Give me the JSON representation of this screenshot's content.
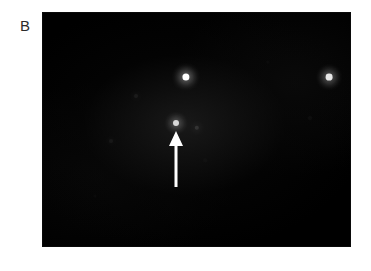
{
  "figure": {
    "panel_label": "B",
    "label_color": "#2b2b2b",
    "background_color": "#ffffff",
    "image_background_color": "#000000",
    "image_region": {
      "x": 43,
      "y": 13,
      "width": 307,
      "height": 233
    },
    "modality": "dark-field fluorescence micrograph"
  },
  "annotations": {
    "arrow": {
      "name": "arrow-indicator",
      "direction": "up",
      "color": "#ffffff",
      "tip_x": 176,
      "tip_y": 131,
      "tail_y": 187,
      "head_width": 14,
      "head_height": 15,
      "shaft_width": 3,
      "points_to": "bright-spot-center"
    }
  },
  "spots": [
    {
      "name": "bright-spot-upper-center",
      "x": 186,
      "y": 77,
      "radius": 3.6,
      "brightness": "#ffffff",
      "intensity": 1.0
    },
    {
      "name": "bright-spot-right",
      "x": 329,
      "y": 77,
      "radius": 3.4,
      "brightness": "#f4f4f4",
      "intensity": 0.95
    },
    {
      "name": "bright-spot-center",
      "x": 176,
      "y": 123,
      "radius": 3.0,
      "brightness": "#ededed",
      "intensity": 0.9
    },
    {
      "name": "faint-spot-right-of-center",
      "x": 197,
      "y": 128,
      "radius": 2.2,
      "brightness": "#6a6a6a",
      "intensity": 0.35
    },
    {
      "name": "faint-spot-upper-left",
      "x": 136,
      "y": 96,
      "radius": 2.0,
      "brightness": "#4a4a4a",
      "intensity": 0.25
    },
    {
      "name": "faint-spot-left",
      "x": 111,
      "y": 141,
      "radius": 2.0,
      "brightness": "#474747",
      "intensity": 0.22
    },
    {
      "name": "faint-spot-far-right",
      "x": 310,
      "y": 118,
      "radius": 2.0,
      "brightness": "#2e2e2e",
      "intensity": 0.14
    },
    {
      "name": "faint-spot-lower-center",
      "x": 205,
      "y": 160,
      "radius": 1.8,
      "brightness": "#242424",
      "intensity": 0.1
    },
    {
      "name": "faint-spot-upper-right",
      "x": 268,
      "y": 62,
      "radius": 1.6,
      "brightness": "#212121",
      "intensity": 0.09
    },
    {
      "name": "faint-spot-lower-left",
      "x": 95,
      "y": 196,
      "radius": 1.6,
      "brightness": "#1d1d1d",
      "intensity": 0.08
    }
  ]
}
